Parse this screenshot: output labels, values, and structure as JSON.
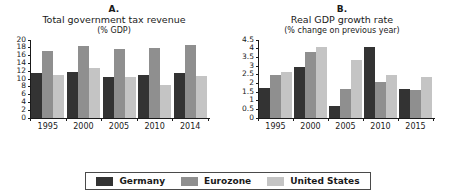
{
  "series_colors": {
    "Germany": "#333333",
    "Eurozone": "#8f8f8f",
    "United States": "#c4c4c4"
  },
  "legend": {
    "position": "bottom-center",
    "entries": [
      {
        "label": "Germany",
        "color": "#333333",
        "swatch_name": "legend-swatch-germany"
      },
      {
        "label": "Eurozone",
        "color": "#8f8f8f",
        "swatch_name": "legend-swatch-eurozone"
      },
      {
        "label": "United States",
        "color": "#c4c4c4",
        "swatch_name": "legend-swatch-united-states"
      }
    ]
  },
  "panel_a": {
    "letter": "A.",
    "title": "Total government tax revenue",
    "subtitle": "(% GDP)"
  },
  "panel_b": {
    "letter": "B.",
    "title": "Real GDP growth rate",
    "subtitle": "(% change on previous year)"
  },
  "chart_data": [
    {
      "type": "bar",
      "id": "panel-a",
      "title": "A. Total government tax revenue",
      "subtitle": "(% GDP)",
      "xlabel": "",
      "ylabel": "",
      "ylim": [
        0,
        20
      ],
      "yticks": [
        0,
        2,
        4,
        6,
        8,
        10,
        12,
        14,
        16,
        18,
        20
      ],
      "ytick_labels": [
        "0",
        "2",
        "4",
        "6",
        "8",
        "10",
        "12",
        "14",
        "16",
        "18",
        "20"
      ],
      "grid": false,
      "legend": "bottom",
      "categories": [
        "1995",
        "2000",
        "2005",
        "2010",
        "2014"
      ],
      "series": [
        {
          "name": "Germany",
          "color": "#333333",
          "values": [
            11.4,
            11.6,
            10.4,
            11.0,
            11.4
          ]
        },
        {
          "name": "Eurozone",
          "color": "#8f8f8f",
          "values": [
            17.1,
            18.5,
            17.6,
            17.8,
            18.6
          ]
        },
        {
          "name": "United States",
          "color": "#c4c4c4",
          "values": [
            10.9,
            12.8,
            10.4,
            8.3,
            10.7
          ]
        }
      ]
    },
    {
      "type": "bar",
      "id": "panel-b",
      "title": "B. Real GDP growth rate",
      "subtitle": "(% change on previous year)",
      "xlabel": "",
      "ylabel": "",
      "ylim": [
        0,
        4.5
      ],
      "yticks": [
        0,
        0.5,
        1,
        1.5,
        2,
        2.5,
        3,
        3.5,
        4,
        4.5
      ],
      "ytick_labels": [
        "0",
        "0.5",
        "1",
        "1.5",
        "2",
        "2.5",
        "3",
        "3.5",
        "4",
        "4.5"
      ],
      "grid": false,
      "legend": "bottom",
      "categories": [
        "1995",
        "2000",
        "2005",
        "2010",
        "2015"
      ],
      "series": [
        {
          "name": "Germany",
          "color": "#333333",
          "values": [
            1.7,
            2.9,
            0.7,
            4.05,
            1.65
          ]
        },
        {
          "name": "Eurozone",
          "color": "#8f8f8f",
          "values": [
            2.45,
            3.8,
            1.65,
            2.05,
            1.6
          ]
        },
        {
          "name": "United States",
          "color": "#c4c4c4",
          "values": [
            2.65,
            4.1,
            3.3,
            2.45,
            2.35
          ]
        }
      ]
    }
  ]
}
